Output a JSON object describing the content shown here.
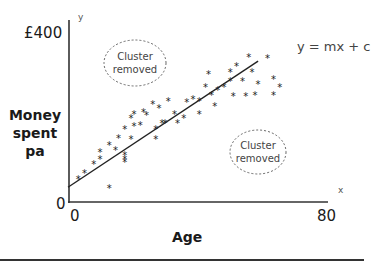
{
  "chart_data": {
    "type": "scatter",
    "title": "",
    "xlabel": "Age",
    "ylabel": "Money spent pa",
    "x_axis_letter": "x",
    "y_axis_letter": "y",
    "xlim": [
      0,
      80
    ],
    "ylim": [
      0,
      400
    ],
    "x_tick_labels": [
      "0",
      "80"
    ],
    "y_tick_labels": [
      "0",
      "£400"
    ],
    "y_max_label": "£400",
    "y_origin_label": "0",
    "x_origin_label": "0",
    "x_max_label": "80",
    "grid": false,
    "trend_line": {
      "label": "y = mx + c",
      "start": {
        "x": 0,
        "y": 36
      },
      "end": {
        "x": 61,
        "y": 322
      }
    },
    "annotations": [
      {
        "text": "Cluster\nremoved",
        "position": "upper-left",
        "shape": "dashed-ellipse"
      },
      {
        "text": "Cluster\nremoved",
        "position": "lower-right",
        "shape": "dashed-ellipse"
      }
    ],
    "series": [
      {
        "name": "observations",
        "marker": "asterisk",
        "points": [
          [
            3,
            53
          ],
          [
            5,
            66
          ],
          [
            8,
            86
          ],
          [
            10,
            114
          ],
          [
            10,
            99
          ],
          [
            13,
            130
          ],
          [
            13,
            31
          ],
          [
            15,
            119
          ],
          [
            16,
            147
          ],
          [
            18,
            167
          ],
          [
            18,
            108
          ],
          [
            18,
            92
          ],
          [
            18,
            99
          ],
          [
            20,
            145
          ],
          [
            21,
            202
          ],
          [
            20,
            191
          ],
          [
            21,
            174
          ],
          [
            23,
            176
          ],
          [
            24,
            206
          ],
          [
            25,
            198
          ],
          [
            27,
            224
          ],
          [
            28,
            143
          ],
          [
            29,
            215
          ],
          [
            28,
            167
          ],
          [
            30,
            180
          ],
          [
            31,
            180
          ],
          [
            32,
            230
          ],
          [
            34,
            202
          ],
          [
            35,
            180
          ],
          [
            37,
            193
          ],
          [
            38,
            228
          ],
          [
            40,
            235
          ],
          [
            42,
            230
          ],
          [
            42,
            202
          ],
          [
            44,
            264
          ],
          [
            45,
            292
          ],
          [
            46,
            244
          ],
          [
            47,
            220
          ],
          [
            48,
            257
          ],
          [
            52,
            297
          ],
          [
            52,
            277
          ],
          [
            54,
            310
          ],
          [
            56,
            277
          ],
          [
            57,
            242
          ],
          [
            58,
            332
          ],
          [
            59,
            297
          ],
          [
            61,
            270
          ],
          [
            60,
            244
          ],
          [
            64,
            330
          ],
          [
            66,
            281
          ],
          [
            66,
            244
          ],
          [
            68,
            262
          ],
          [
            53,
            242
          ],
          [
            50,
            264
          ]
        ]
      }
    ]
  },
  "plot_px": {
    "origin": {
      "x": 69,
      "y": 202
    },
    "x_end": 328,
    "y_top": 20,
    "x_scale_px_per_unit": 3.1,
    "y_scale_px_per_unit": 0.4375,
    "ellipses": [
      {
        "cx": 135,
        "cy": 63,
        "rx": 31,
        "ry": 23
      },
      {
        "cx": 258,
        "cy": 152,
        "rx": 28,
        "ry": 22
      }
    ]
  },
  "colors": {
    "axis": "#333333",
    "points": "#222222",
    "line": "#222222",
    "ellipse": "#666666"
  }
}
